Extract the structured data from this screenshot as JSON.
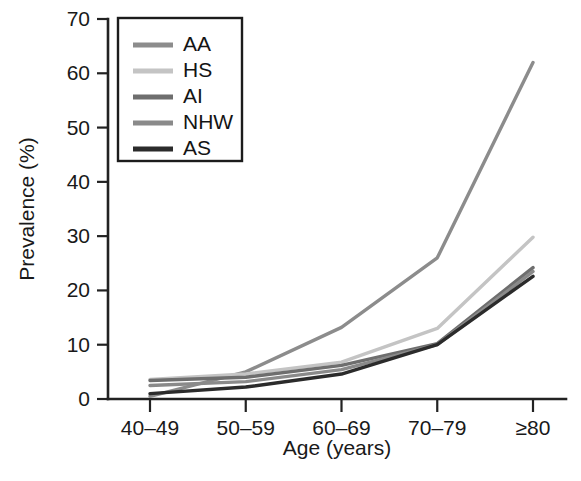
{
  "chart_data": {
    "type": "line",
    "title": "",
    "xlabel": "Age (years)",
    "ylabel": "Prevalence (%)",
    "categories": [
      "40–49",
      "50–59",
      "60–69",
      "70–79",
      "≥80"
    ],
    "ylim": [
      0,
      70
    ],
    "yticks": [
      0,
      10,
      20,
      30,
      40,
      50,
      60,
      70
    ],
    "ytick_labels": [
      "0",
      "10",
      "20",
      "30",
      "40",
      "50",
      "60",
      "70"
    ],
    "grid": false,
    "legend_position": "upper-left",
    "series": [
      {
        "name": "AA",
        "values": [
          0.5,
          5.0,
          13.2,
          26.0,
          62.0
        ],
        "color": "#8c8c8c"
      },
      {
        "name": "HS",
        "values": [
          3.6,
          4.6,
          6.8,
          13.0,
          29.8
        ],
        "color": "#c4c4c4"
      },
      {
        "name": "AI",
        "values": [
          3.4,
          4.0,
          6.2,
          10.2,
          24.2
        ],
        "color": "#6e6e6e"
      },
      {
        "name": "NHW",
        "values": [
          2.5,
          3.2,
          5.4,
          10.0,
          23.5
        ],
        "color": "#8a8a8a"
      },
      {
        "name": "AS",
        "values": [
          1.0,
          2.2,
          4.6,
          10.0,
          22.6
        ],
        "color": "#2b2b2b"
      }
    ]
  }
}
